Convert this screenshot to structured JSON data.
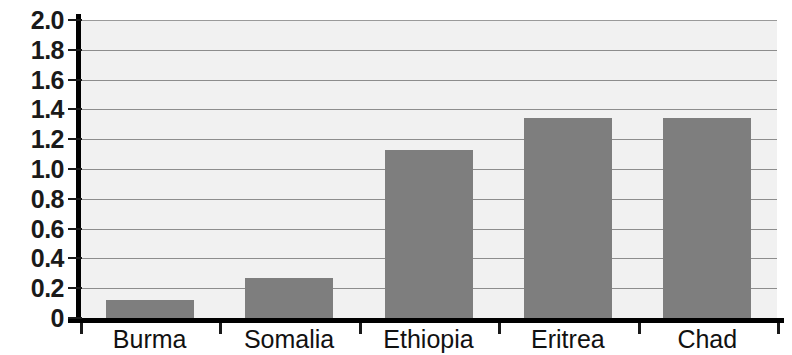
{
  "chart_data": {
    "type": "bar",
    "title": "",
    "xlabel": "",
    "ylabel": "",
    "categories": [
      "Burma",
      "Somalia",
      "Ethiopia",
      "Eritrea",
      "Chad"
    ],
    "values": [
      0.12,
      0.27,
      1.13,
      1.34,
      1.34
    ],
    "series": [
      {
        "name": "value",
        "values": [
          0.12,
          0.27,
          1.13,
          1.34,
          1.34
        ]
      }
    ],
    "ylim": [
      0,
      2.0
    ],
    "ytick_labels": [
      "2.0",
      "1.8",
      "1.6",
      "1.4",
      "1.2",
      "1.0",
      "0.8",
      "0.6",
      "0.4",
      "0.2",
      "0"
    ],
    "ytick_values": [
      2.0,
      1.8,
      1.6,
      1.4,
      1.2,
      1.0,
      0.8,
      0.6,
      0.4,
      0.2,
      0
    ],
    "grid": true,
    "grid_axis": "y",
    "legend": false,
    "legend_position": "none",
    "colors": {
      "bar": "#7e7e7e",
      "plot_background": "#f1f1f1",
      "gridline": "#8d8d8d",
      "axis": "#000000",
      "text": "#111111",
      "page_background": "#ffffff"
    }
  }
}
